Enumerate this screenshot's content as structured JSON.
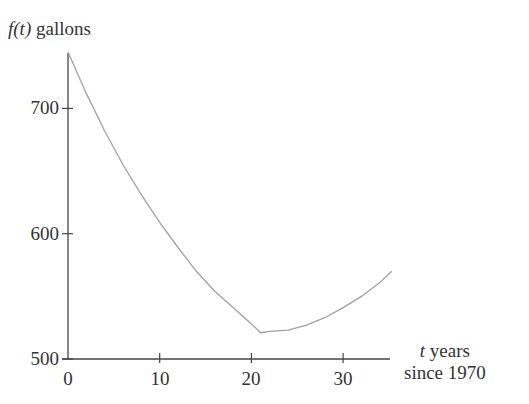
{
  "chart_data": {
    "type": "line",
    "title": "",
    "ylabel_italic": "f(t)",
    "ylabel_rest": " gallons",
    "xlabel_italic": "t",
    "xlabel_line1_rest": " years",
    "xlabel_line2": "since 1970",
    "xlim": [
      0,
      35
    ],
    "ylim": [
      500,
      745
    ],
    "xticks": [
      0,
      10,
      20,
      30
    ],
    "yticks": [
      500,
      600,
      700
    ],
    "grid": false,
    "series": [
      {
        "name": "f(t)",
        "x": [
          0,
          2,
          4,
          6,
          8,
          10,
          12,
          14,
          16,
          18,
          20,
          21,
          22,
          24,
          26,
          28,
          30,
          32,
          34,
          35.3
        ],
        "values": [
          745,
          712,
          682,
          655,
          631,
          609,
          589,
          570,
          554,
          541,
          528,
          521,
          522,
          523,
          527,
          533,
          541,
          550,
          561,
          570
        ]
      }
    ],
    "line_color": "#a0a0a0",
    "axis_color": "#444444"
  }
}
